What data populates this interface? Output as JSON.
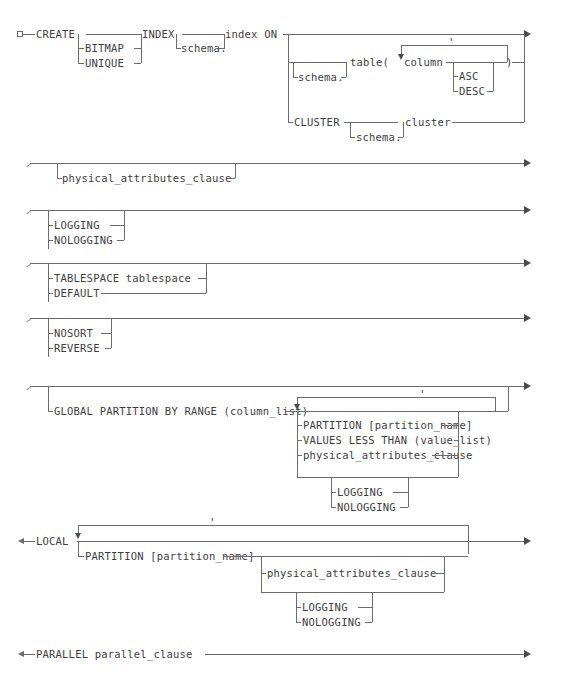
{
  "diagram": {
    "line_color": "#6b6b6b",
    "text_color": "#3d3d3d",
    "background": "#ffffff"
  },
  "tokens": {
    "create": "CREATE",
    "bitmap": "BITMAP",
    "unique": "UNIQUE",
    "index_kw": "INDEX",
    "schema_dot": "schema.",
    "index_on": "index ON",
    "table_paren": "table(",
    "column": "column",
    "comma": "'",
    "asc": "ASC",
    "desc": "DESC",
    "close_paren": ")",
    "cluster_kw": "CLUSTER",
    "cluster": "cluster",
    "physical_attributes_clause": "physical_attributes_clause",
    "logging": "LOGGING",
    "nologging": "NOLOGGING",
    "tablespace": "TABLESPACE tablespace",
    "default": "DEFAULT",
    "nosort": "NOSORT",
    "reverse": "REVERSE",
    "global_partition": "GLOBAL PARTITION BY RANGE (column_list)",
    "partition_name": "PARTITION [partition_name]",
    "values_less_than": "VALUES LESS THAN (value_list)",
    "local": "LOCAL",
    "parallel": "PARALLEL parallel_clause"
  },
  "sections": [
    {
      "id": "create-index",
      "label": "CREATE INDEX header"
    },
    {
      "id": "physical-attributes",
      "label": "physical_attributes_clause"
    },
    {
      "id": "logging",
      "label": "LOGGING / NOLOGGING"
    },
    {
      "id": "tablespace",
      "label": "TABLESPACE / DEFAULT"
    },
    {
      "id": "sort",
      "label": "NOSORT / REVERSE"
    },
    {
      "id": "global-partition",
      "label": "GLOBAL PARTITION BY RANGE"
    },
    {
      "id": "local-partition",
      "label": "LOCAL partitions"
    },
    {
      "id": "parallel",
      "label": "PARALLEL parallel_clause"
    }
  ]
}
